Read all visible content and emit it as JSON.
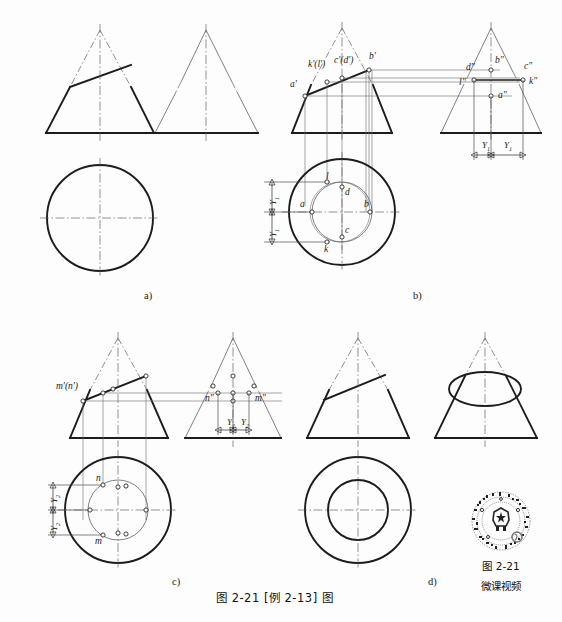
{
  "figure": {
    "caption": "图 2-21  [例 2-13] 图",
    "caption_number": "图 2-21",
    "caption_title": "[例 2-13] 图",
    "background": "#fdfdfd",
    "line_color": "#1c1c1c",
    "thin_line_color": "#4a4a4a"
  },
  "panels": [
    {
      "id": "a",
      "label": "a)",
      "x": 144,
      "y": 290,
      "description": "Given: cone front view with inclined cutting plane, side view, top view circle"
    },
    {
      "id": "b",
      "label": "b)",
      "x": 413,
      "y": 290,
      "description": "Construction of points A, B, C, D, K, L on the ellipse"
    },
    {
      "id": "c",
      "label": "c)",
      "x": 172,
      "y": 576,
      "description": "Construction of auxiliary points M and N"
    },
    {
      "id": "d",
      "label": "d)",
      "x": 428,
      "y": 576,
      "description": "Completed three views of truncated cone"
    }
  ],
  "labels": {
    "panel_b_front": [
      {
        "text": "a'",
        "x": 292,
        "y": 86
      },
      {
        "text": "k'(l')",
        "x": 312,
        "y": 66
      },
      {
        "text": "c'(d')",
        "x": 337,
        "y": 62
      },
      {
        "text": "b'",
        "x": 370,
        "y": 55
      }
    ],
    "panel_b_side": [
      {
        "text": "d\"",
        "x": 468,
        "y": 68
      },
      {
        "text": "b\"",
        "x": 496,
        "y": 60
      },
      {
        "text": "c\"",
        "x": 527,
        "y": 66
      },
      {
        "text": "k\"",
        "x": 533,
        "y": 80
      },
      {
        "text": "l\"",
        "x": 459,
        "y": 81
      },
      {
        "text": "a\"",
        "x": 504,
        "y": 91
      }
    ],
    "panel_b_top": [
      {
        "text": "l",
        "x": 327,
        "y": 176
      },
      {
        "text": "d",
        "x": 341,
        "y": 195
      },
      {
        "text": "a",
        "x": 301,
        "y": 204
      },
      {
        "text": "b",
        "x": 365,
        "y": 204
      },
      {
        "text": "c",
        "x": 341,
        "y": 229
      },
      {
        "text": "k",
        "x": 326,
        "y": 249
      }
    ],
    "panel_c_front": [
      {
        "text": "m'(n')",
        "x": 82,
        "y": 379
      }
    ],
    "panel_c_side": [
      {
        "text": "n\"",
        "x": 206,
        "y": 397
      },
      {
        "text": "m\"",
        "x": 259,
        "y": 397
      }
    ],
    "panel_c_top": [
      {
        "text": "n",
        "x": 86,
        "y": 478
      },
      {
        "text": "m",
        "x": 86,
        "y": 538
      }
    ]
  },
  "dimensions": {
    "panel_b_side": [
      {
        "text": "Y",
        "sub": "1",
        "x": 451,
        "y": 147
      },
      {
        "text": "Y",
        "sub": "1",
        "x": 487,
        "y": 147
      }
    ],
    "panel_b_top": [
      {
        "text": "Y",
        "sub": "1",
        "x": 271,
        "y": 196
      },
      {
        "text": "Y",
        "sub": "1",
        "x": 271,
        "y": 230
      }
    ],
    "panel_c_side": [
      {
        "text": "Y",
        "sub": "2",
        "x": 220,
        "y": 434
      },
      {
        "text": "Y",
        "sub": "2",
        "x": 246,
        "y": 434
      }
    ],
    "panel_c_top": [
      {
        "text": "Y",
        "sub": "2",
        "x": 38,
        "y": 495
      },
      {
        "text": "Y",
        "sub": "2",
        "x": 38,
        "y": 525
      }
    ]
  },
  "qr": {
    "caption_line1": "图 2-21",
    "caption_line2": "微课视频",
    "alt": "qr-code"
  }
}
